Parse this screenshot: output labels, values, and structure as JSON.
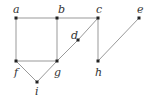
{
  "graph": {
    "vertices": [
      {
        "id": "a",
        "label": "a",
        "x": 16,
        "y": 18,
        "lx": 13,
        "ly": 13
      },
      {
        "id": "b",
        "label": "b",
        "x": 57,
        "y": 18,
        "lx": 58,
        "ly": 13
      },
      {
        "id": "c",
        "label": "c",
        "x": 98,
        "y": 18,
        "lx": 96,
        "ly": 13
      },
      {
        "id": "e",
        "label": "e",
        "x": 139,
        "y": 18,
        "lx": 137,
        "ly": 13
      },
      {
        "id": "d",
        "label": "d",
        "x": 78,
        "y": 40,
        "lx": 71,
        "ly": 39
      },
      {
        "id": "f",
        "label": "f",
        "x": 16,
        "y": 61,
        "lx": 14,
        "ly": 76
      },
      {
        "id": "g",
        "label": "g",
        "x": 57,
        "y": 61,
        "lx": 54,
        "ly": 76
      },
      {
        "id": "h",
        "label": "h",
        "x": 98,
        "y": 61,
        "lx": 95,
        "ly": 76
      },
      {
        "id": "i",
        "label": "i",
        "x": 37,
        "y": 82,
        "lx": 35,
        "ly": 95
      }
    ],
    "edges": [
      [
        "a",
        "b"
      ],
      [
        "b",
        "c"
      ],
      [
        "a",
        "f"
      ],
      [
        "b",
        "g"
      ],
      [
        "f",
        "g"
      ],
      [
        "c",
        "d"
      ],
      [
        "d",
        "g"
      ],
      [
        "c",
        "h"
      ],
      [
        "h",
        "e"
      ],
      [
        "f",
        "i"
      ],
      [
        "i",
        "g"
      ]
    ],
    "edge_color": "#999999",
    "vertex_color": "#222222"
  }
}
